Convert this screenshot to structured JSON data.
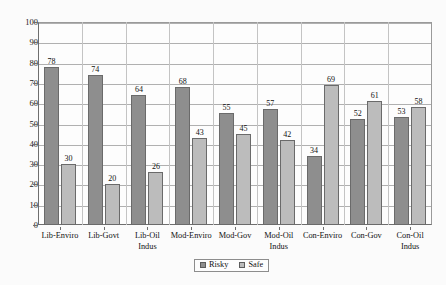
{
  "chart_data": {
    "type": "bar",
    "title": "",
    "subtitle": "",
    "xlabel": "",
    "ylabel": "",
    "ylim": [
      0,
      100
    ],
    "ytick_step": 10,
    "yticks": [
      "100",
      "90",
      "80",
      "70",
      "60",
      "50",
      "40",
      "30",
      "20",
      "10",
      "0"
    ],
    "grid": true,
    "legend_position": "bottom-center",
    "categories": [
      "Lib-Enviro",
      "Lib-Govt",
      "Lib-Oil Indus",
      "Mod-Enviro",
      "Mod-Gov",
      "Mod-Oil Indus",
      "Con-Enviro",
      "Con-Gov",
      "Con-Oil Indus"
    ],
    "series": [
      {
        "name": "Risky",
        "color": "#8e8e8e",
        "values": [
          78,
          74,
          64,
          68,
          55,
          57,
          34,
          52,
          53
        ]
      },
      {
        "name": "Safe",
        "color": "#bcbcbc",
        "values": [
          30,
          20,
          26,
          43,
          45,
          42,
          69,
          61,
          58
        ]
      }
    ]
  },
  "legend": {
    "items": [
      {
        "label": "Risky",
        "swatch": "risky"
      },
      {
        "label": "Safe",
        "swatch": "safe"
      }
    ]
  },
  "colors": {
    "risky": "#8e8e8e",
    "safe": "#bcbcbc",
    "axis": "#6e6e6e",
    "grid": "#b0b0b0",
    "background": "#fbfbfb"
  }
}
